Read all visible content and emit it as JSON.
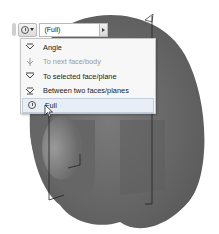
{
  "toolbar": {
    "icon": "clock-icon",
    "selected_value": "(Full)"
  },
  "menu": {
    "items": [
      {
        "label": "Angle",
        "icon": "angle-icon",
        "enabled": true,
        "selected": false
      },
      {
        "label": "To next face/body",
        "icon": "next-face-icon",
        "enabled": false,
        "selected": false
      },
      {
        "label": "To selected face/plane",
        "icon": "selected-face-icon",
        "enabled": true,
        "selected": false
      },
      {
        "label": "Between two faces/planes",
        "icon": "between-faces-icon",
        "enabled": true,
        "selected": false
      },
      {
        "label": "Full",
        "icon": "clock-icon",
        "enabled": true,
        "selected": true
      }
    ]
  },
  "colors": {
    "part_body": "#6e6e6e",
    "part_body_dark": "#5a5a5a",
    "menu_bg": "#f7f7f7",
    "selected_bg": "#e8eef6"
  }
}
